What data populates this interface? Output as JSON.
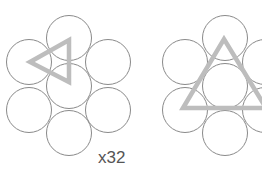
{
  "figures": [
    {
      "name": "left-hex-cluster",
      "circles": [
        {
          "cx": 69,
          "cy": 38
        },
        {
          "cx": 29,
          "cy": 62
        },
        {
          "cx": 108,
          "cy": 62
        },
        {
          "cx": 69,
          "cy": 86
        },
        {
          "cx": 29,
          "cy": 110
        },
        {
          "cx": 108,
          "cy": 110
        },
        {
          "cx": 69,
          "cy": 133
        }
      ],
      "radius": 22.5,
      "triangle": [
        [
          30,
          62
        ],
        [
          69,
          40
        ],
        [
          69,
          82
        ]
      ]
    },
    {
      "name": "right-hex-cluster",
      "circles": [
        {
          "cx": 225,
          "cy": 38
        },
        {
          "cx": 185,
          "cy": 62
        },
        {
          "cx": 265,
          "cy": 62
        },
        {
          "cx": 225,
          "cy": 86
        },
        {
          "cx": 185,
          "cy": 110
        },
        {
          "cx": 265,
          "cy": 110
        },
        {
          "cx": 225,
          "cy": 133
        }
      ],
      "radius": 22.5,
      "triangle": [
        [
          183,
          108
        ],
        [
          224,
          39
        ],
        [
          266,
          108
        ]
      ]
    }
  ],
  "multiplier_label": "x32",
  "colors": {
    "circle_stroke": "#8a8a8a",
    "triangle_stroke": "#bdbdbd",
    "label": "#555555"
  }
}
